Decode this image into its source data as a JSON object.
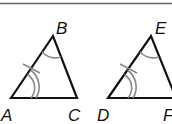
{
  "figure": {
    "triangles": [
      {
        "name": "ABC",
        "vertices": {
          "A": "A",
          "B": "B",
          "C": "C"
        }
      },
      {
        "name": "DEF",
        "vertices": {
          "D": "D",
          "E": "E",
          "F": "F"
        }
      }
    ],
    "markings": {
      "side_tick": "single tick on AB and DE",
      "angle_double_arc": "angles A and D",
      "angle_single_arc": "angles B and E"
    },
    "colors": {
      "line": "#111111",
      "marking": "#888888",
      "rule": "#555555"
    }
  }
}
